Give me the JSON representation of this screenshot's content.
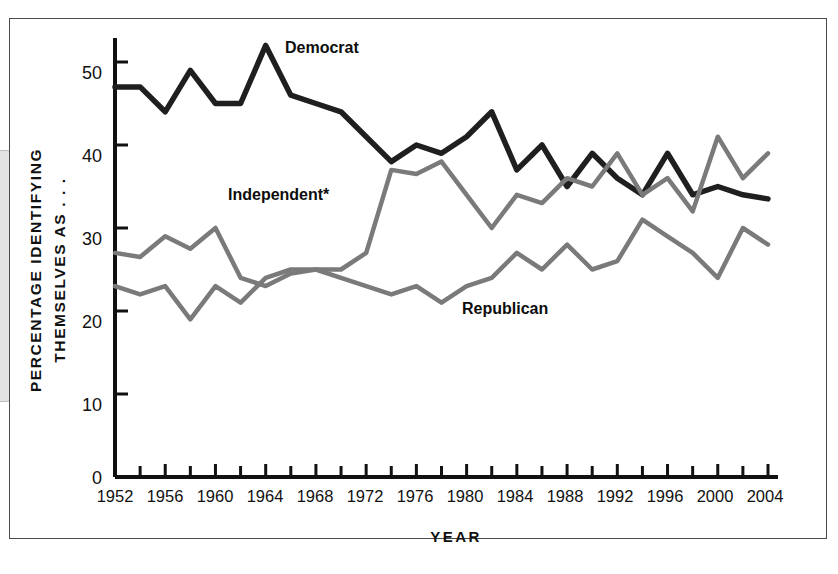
{
  "figure": {
    "background_color": "#ffffff",
    "frame_color": "#4a4a4a"
  },
  "axes": {
    "y_title_line1": "PERCENTAGE IDENTIFYING",
    "y_title_line2": "THEMSELVES AS . . .",
    "x_title": "YEAR",
    "y_ticks": [
      "0",
      "10",
      "20",
      "30",
      "40",
      "50"
    ],
    "x_ticks": [
      "1952",
      "1956",
      "1960",
      "1964",
      "1968",
      "1972",
      "1976",
      "1980",
      "1984",
      "1988",
      "1992",
      "1996",
      "2000",
      "2004"
    ]
  },
  "labels": {
    "democrat": "Democrat",
    "independent": "Independent*",
    "republican": "Republican"
  },
  "chart_data": {
    "type": "line",
    "title": "",
    "xlabel": "YEAR",
    "ylabel": "PERCENTAGE IDENTIFYING THEMSELVES AS . . .",
    "xlim": [
      1952,
      2004
    ],
    "ylim": [
      0,
      52
    ],
    "y_ticks": [
      0,
      10,
      20,
      30,
      40,
      50
    ],
    "x_ticks": [
      1952,
      1956,
      1960,
      1964,
      1968,
      1972,
      1976,
      1980,
      1984,
      1988,
      1992,
      1996,
      2000,
      2004
    ],
    "x_minor_tick_step": 2,
    "grid": false,
    "legend": "inline-annotations",
    "x": [
      1952,
      1954,
      1956,
      1958,
      1960,
      1962,
      1964,
      1966,
      1968,
      1970,
      1972,
      1974,
      1976,
      1978,
      1980,
      1982,
      1984,
      1986,
      1988,
      1990,
      1992,
      1994,
      1996,
      1998,
      2000,
      2002,
      2004
    ],
    "series": [
      {
        "name": "Democrat",
        "color": "#1f1f1f",
        "values": [
          47,
          47,
          44,
          49,
          45,
          45,
          52,
          46,
          45,
          44,
          41,
          38,
          40,
          39,
          41,
          44,
          37,
          40,
          35,
          39,
          36,
          34,
          39,
          34,
          35,
          34,
          33.5
        ]
      },
      {
        "name": "Independent*",
        "color": "#7a7a7a",
        "values": [
          27,
          26.5,
          29,
          27.5,
          30,
          24,
          23,
          24.5,
          25,
          25,
          27,
          37,
          36.5,
          38,
          34,
          30,
          34,
          33,
          36,
          35,
          39,
          34,
          36,
          32,
          41,
          36,
          39
        ]
      },
      {
        "name": "Republican",
        "color": "#7a7a7a",
        "values": [
          23,
          22,
          23,
          19,
          23,
          21,
          24,
          25,
          25,
          24,
          23,
          22,
          23,
          21,
          23,
          24,
          27,
          25,
          28,
          25,
          26,
          31,
          29,
          27,
          24,
          30,
          28
        ]
      }
    ]
  }
}
